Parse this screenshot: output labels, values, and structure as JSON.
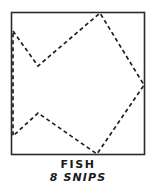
{
  "figure": {
    "name": "fish-origami-cut-diagram",
    "caption_primary": "FISH",
    "caption_secondary": "8 SNIPS",
    "colors": {
      "ink": "#1a1a1a",
      "paper": "#ffffff",
      "border": "#2b2b2b",
      "cut_line": "#1f1f1f"
    }
  },
  "chart_data": {
    "type": "diagram",
    "title": "FISH",
    "subtitle": "8 SNIPS",
    "xlabel": "",
    "ylabel": "",
    "grid": false,
    "legend": null,
    "xlim": [
      0,
      156
    ],
    "ylim": [
      0,
      187
    ],
    "paper_square": {
      "name": "paper-boundary",
      "style": "solid",
      "x": 11,
      "y": 12,
      "width": 134,
      "height": 143,
      "corners": [
        [
          11,
          12
        ],
        [
          145,
          12
        ],
        [
          145,
          155
        ],
        [
          11,
          155
        ]
      ]
    },
    "cut_path": {
      "name": "fish-cut-path",
      "style": "dashed",
      "dash_pattern": [
        4,
        3
      ],
      "segment_count": 8,
      "vertices": [
        [
          13,
          31
        ],
        [
          38,
          66
        ],
        [
          100,
          13
        ],
        [
          144,
          85
        ],
        [
          97,
          154
        ],
        [
          38,
          113
        ],
        [
          13,
          136
        ],
        [
          13,
          31
        ]
      ],
      "segments": [
        {
          "index": 1,
          "from": [
            13,
            31
          ],
          "to": [
            38,
            66
          ]
        },
        {
          "index": 2,
          "from": [
            38,
            66
          ],
          "to": [
            100,
            13
          ]
        },
        {
          "index": 3,
          "from": [
            100,
            13
          ],
          "to": [
            144,
            85
          ]
        },
        {
          "index": 4,
          "from": [
            144,
            85
          ],
          "to": [
            97,
            154
          ]
        },
        {
          "index": 5,
          "from": [
            97,
            154
          ],
          "to": [
            38,
            113
          ]
        },
        {
          "index": 6,
          "from": [
            38,
            113
          ],
          "to": [
            13,
            136
          ]
        },
        {
          "index": 7,
          "from": [
            13,
            136
          ],
          "to": [
            13,
            31
          ]
        }
      ]
    }
  }
}
